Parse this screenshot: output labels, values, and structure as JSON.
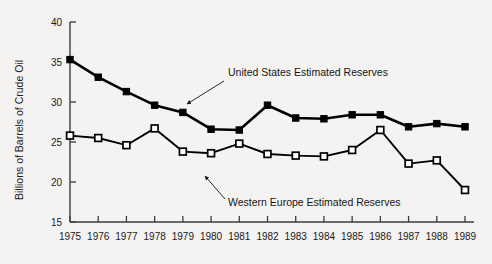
{
  "chart_data": {
    "type": "line",
    "title": "",
    "subtitle": "",
    "xlabel": "",
    "ylabel": "Billions of Barrels of Crude Oil",
    "categories": [
      "1975",
      "1976",
      "1977",
      "1978",
      "1979",
      "1980",
      "1981",
      "1982",
      "1983",
      "1984",
      "1985",
      "1986",
      "1987",
      "1988",
      "1989"
    ],
    "x": [
      1975,
      1976,
      1977,
      1978,
      1979,
      1980,
      1981,
      1982,
      1983,
      1984,
      1985,
      1986,
      1987,
      1988,
      1989
    ],
    "xlim": [
      1975,
      1989
    ],
    "ylim": [
      15,
      40
    ],
    "yticks": [
      15,
      20,
      25,
      30,
      35,
      40
    ],
    "xticks": [
      "1975",
      "1976",
      "1977",
      "1978",
      "1979",
      "1980",
      "1981",
      "1982",
      "1983",
      "1984",
      "1985",
      "1986",
      "1987",
      "1988",
      "1989"
    ],
    "grid": false,
    "legend": "annotations-inline",
    "series": [
      {
        "name": "United States Estimated Reserves",
        "marker": "filled-square",
        "color": "#000000",
        "values": [
          35.3,
          33.1,
          31.3,
          29.6,
          28.7,
          26.6,
          26.5,
          29.6,
          28.0,
          27.9,
          28.4,
          28.4,
          26.9,
          27.3,
          26.9
        ]
      },
      {
        "name": "Western Europe Estimated Reserves",
        "marker": "open-square",
        "color": "#000000",
        "values": [
          25.8,
          25.5,
          24.6,
          26.7,
          23.8,
          23.6,
          24.8,
          23.5,
          23.3,
          23.2,
          24.0,
          26.5,
          22.3,
          22.7,
          19.0
        ]
      }
    ],
    "annotations": [
      {
        "name": "us-annotation",
        "text": "United States Estimated Reserves",
        "text_x": 228,
        "text_y": 76,
        "leader_from_x": 224,
        "leader_from_y": 81,
        "leader_to_x": 187,
        "leader_to_y": 104
      },
      {
        "name": "we-annotation",
        "text": "Western Europe Estimated Reserves",
        "text_x": 228,
        "text_y": 206,
        "leader_from_x": 225,
        "leader_from_y": 199,
        "leader_to_x": 205,
        "leader_to_y": 176
      }
    ],
    "colors": {
      "background": "#f4f3f1",
      "axis": "#3b3b3b",
      "series_line": "#000000",
      "text": "#1a1a1a"
    }
  }
}
